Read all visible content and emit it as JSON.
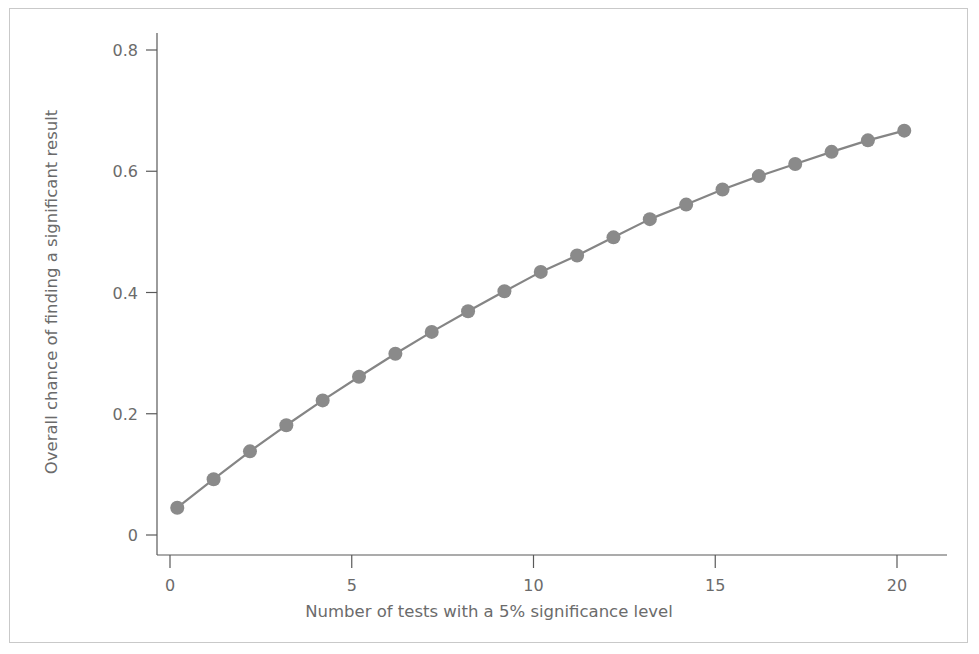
{
  "figure": {
    "background_color": "#ffffff",
    "border_color": "#c9c9c9"
  },
  "chart_data": {
    "type": "line",
    "title": "",
    "subtitle": "",
    "xlabel": "Number of tests with a 5% significance level",
    "ylabel": "Overall chance of finding a significant result",
    "xlim": [
      -0.6,
      21.0
    ],
    "ylim": [
      0.0,
      0.84
    ],
    "xticks": [
      0,
      5,
      10,
      15,
      20
    ],
    "xticklabels": [
      "0",
      "5",
      "10",
      "15",
      "20"
    ],
    "yticks": [
      0,
      0.2,
      0.4,
      0.6,
      0.8
    ],
    "yticklabels": [
      "0",
      "0.2",
      "0.4",
      "0.6",
      "0.8"
    ],
    "grid": false,
    "legend": null,
    "line_color": "#858585",
    "marker_color": "#8a8a8a",
    "marker": "circle",
    "marker_size": 7,
    "x": [
      0.2,
      1.2,
      2.2,
      3.2,
      4.2,
      5.2,
      6.2,
      7.2,
      8.2,
      9.2,
      10.2,
      11.2,
      12.2,
      13.2,
      14.2,
      15.2,
      16.2,
      17.2,
      18.2,
      19.2,
      20.2
    ],
    "values": [
      0.045,
      0.092,
      0.138,
      0.181,
      0.222,
      0.261,
      0.299,
      0.335,
      0.369,
      0.402,
      0.434,
      0.461,
      0.491,
      0.521,
      0.545,
      0.57,
      0.592,
      0.612,
      0.632,
      0.651,
      0.667
    ],
    "series": [
      {
        "name": "Overall chance of finding a significant result",
        "values": [
          0.045,
          0.092,
          0.138,
          0.181,
          0.222,
          0.261,
          0.299,
          0.335,
          0.369,
          0.402,
          0.434,
          0.461,
          0.491,
          0.521,
          0.545,
          0.57,
          0.592,
          0.612,
          0.632,
          0.651,
          0.667
        ]
      }
    ]
  },
  "axes": {
    "x_axis_name": "x-axis",
    "y_axis_name": "y-axis"
  }
}
